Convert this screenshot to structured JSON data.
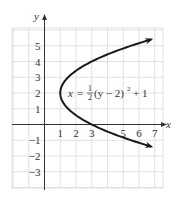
{
  "chart_data": {
    "type": "line",
    "title": "",
    "xlabel": "x",
    "ylabel": "y",
    "xlim": [
      -2,
      7.5
    ],
    "ylim": [
      -4,
      6.2
    ],
    "grid": true,
    "x_ticks": [
      1,
      2,
      3,
      5,
      6,
      7
    ],
    "y_ticks": [
      5,
      4,
      3,
      2,
      1,
      -1,
      -2,
      -3
    ],
    "annotation": {
      "lhs": "x",
      "equals": "=",
      "frac_num": "1",
      "frac_den": "2",
      "body": "(y − 2)",
      "exp": "2",
      "tail": "+ 1"
    },
    "series": [
      {
        "name": "x = 1/2 (y - 2)^2 + 1",
        "equation": "x = (1/2)(y - 2)^2 + 1",
        "vertex": [
          1,
          2
        ],
        "y_range": [
          -1.4,
          5.4
        ],
        "arrows_both_ends": true,
        "points": [
          {
            "x": 6.78,
            "y": 5.4
          },
          {
            "x": 5.5,
            "y": 5
          },
          {
            "x": 3,
            "y": 4
          },
          {
            "x": 1.5,
            "y": 3
          },
          {
            "x": 1,
            "y": 2
          },
          {
            "x": 1.5,
            "y": 1
          },
          {
            "x": 3,
            "y": 0
          },
          {
            "x": 5.5,
            "y": -1
          },
          {
            "x": 6.78,
            "y": -1.4
          }
        ]
      }
    ],
    "colors": {
      "curve": "#1a1a1a",
      "axis": "#333333",
      "grid": "#d9d9d9"
    }
  }
}
